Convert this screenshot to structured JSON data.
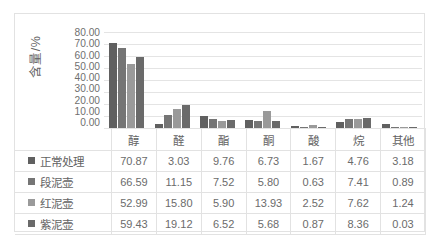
{
  "chart_data": {
    "type": "bar",
    "title": "",
    "xlabel": "",
    "ylabel": "含量/%",
    "ylim": [
      0,
      80
    ],
    "ytick_step": 10,
    "grid": true,
    "legend_position": "data-table-left",
    "categories": [
      "醇",
      "醛",
      "酯",
      "酮",
      "酸",
      "烷",
      "其他"
    ],
    "series": [
      {
        "name": "正常处理",
        "color": "#606060",
        "values": [
          70.87,
          3.03,
          9.76,
          6.73,
          1.67,
          4.76,
          3.18
        ]
      },
      {
        "name": "段泥壶",
        "color": "#757575",
        "values": [
          66.59,
          11.15,
          7.52,
          5.8,
          0.63,
          7.41,
          0.89
        ]
      },
      {
        "name": "红泥壶",
        "color": "#9a9a9a",
        "values": [
          52.99,
          15.8,
          5.9,
          13.93,
          2.52,
          7.62,
          1.24
        ]
      },
      {
        "name": "紫泥壶",
        "color": "#6a6a6a",
        "values": [
          59.43,
          19.12,
          6.52,
          5.68,
          0.87,
          8.36,
          0.03
        ]
      }
    ],
    "ytick_labels": [
      "80.00",
      "70.00",
      "60.00",
      "50.00",
      "40.00",
      "30.00",
      "20.00",
      "10.00",
      "0.00"
    ],
    "value_labels": [
      [
        "70.87",
        "3.03",
        "9.76",
        "6.73",
        "1.67",
        "4.76",
        "3.18"
      ],
      [
        "66.59",
        "11.15",
        "7.52",
        "5.80",
        "0.63",
        "7.41",
        "0.89"
      ],
      [
        "52.99",
        "15.80",
        "5.90",
        "13.93",
        "2.52",
        "7.62",
        "1.24"
      ],
      [
        "59.43",
        "19.12",
        "6.52",
        "5.68",
        "0.87",
        "8.36",
        "0.03"
      ]
    ]
  },
  "colors": {
    "gridline": "#e4e4e4",
    "border": "#e2e2e2",
    "text": "#6b6b6b",
    "header_text": "#636363",
    "background": "#ffffff"
  }
}
